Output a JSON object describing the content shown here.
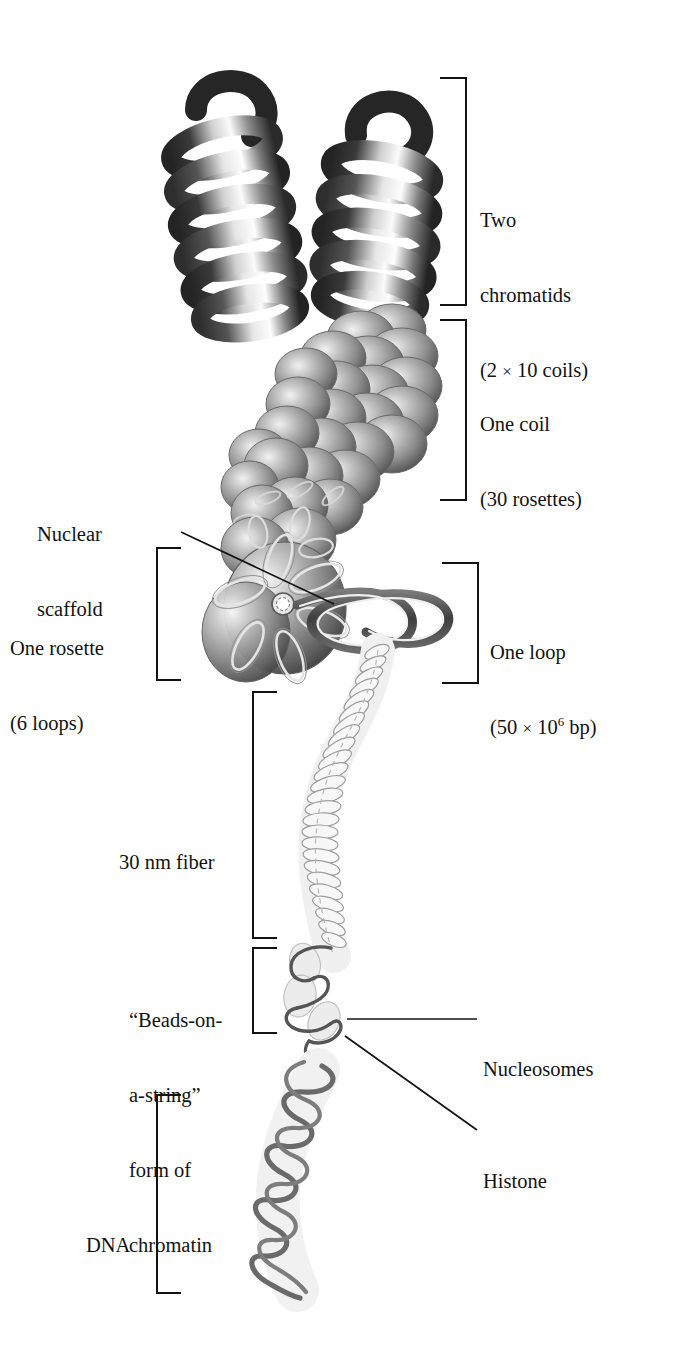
{
  "figure": {
    "background_color": "#ffffff",
    "ink_color": "#131313"
  },
  "labels": {
    "two_chromatids": {
      "line1": "Two",
      "line2": "chromatids",
      "line3_open": "(2 ",
      "line3_times": "×",
      "line3_rest": " 10 coils)"
    },
    "one_coil": {
      "line1": "One coil",
      "line2": "(30 rosettes)"
    },
    "nuclear_scaffold": {
      "line1": "Nuclear",
      "line2": "scaffold"
    },
    "one_rosette": {
      "line1": "One rosette",
      "line2": "(6 loops)"
    },
    "one_loop": {
      "line1": "One loop",
      "line2_open": "(50 ",
      "line2_times": "×",
      "line2_mid": " 10",
      "line2_sup": "6",
      "line2_rest": " bp)"
    },
    "thirty_nm_fiber": {
      "line1": "30 nm fiber"
    },
    "beads_on_a_string": {
      "line1": "“Beads-on-",
      "line2": "a-string”",
      "line3": "form of",
      "line4": "chromatin"
    },
    "nucleosomes": {
      "line1": "Nucleosomes"
    },
    "histone": {
      "line1": "Histone"
    },
    "dna": {
      "line1": "DNA"
    }
  },
  "brackets": [
    {
      "name": "two-chromatids-bracket",
      "side": "right",
      "top": 78,
      "bottom": 305,
      "spine_x": 466,
      "arm_x": 440
    },
    {
      "name": "one-coil-bracket",
      "side": "right",
      "top": 320,
      "bottom": 500,
      "spine_x": 466,
      "arm_x": 440
    },
    {
      "name": "one-loop-bracket",
      "side": "right",
      "top": 563,
      "bottom": 683,
      "spine_x": 478,
      "arm_x": 442
    },
    {
      "name": "one-rosette-bracket",
      "side": "left",
      "top": 548,
      "bottom": 680,
      "spine_x": 157,
      "arm_x": 181
    },
    {
      "name": "thirty-nm-fiber-bracket",
      "side": "left",
      "top": 692,
      "bottom": 938,
      "spine_x": 253,
      "arm_x": 277
    },
    {
      "name": "beads-on-a-string-bracket",
      "side": "left",
      "top": 948,
      "bottom": 1033,
      "spine_x": 253,
      "arm_x": 277
    },
    {
      "name": "dna-bracket",
      "side": "left",
      "top": 1095,
      "bottom": 1293,
      "spine_x": 157,
      "arm_x": 181
    }
  ],
  "leader_lines": [
    {
      "name": "nuclear-scaffold-leader",
      "x1": 181,
      "y1": 532,
      "x2": 334,
      "y2": 604
    },
    {
      "name": "nucleosomes-leader",
      "x1": 347,
      "y1": 1019,
      "x2": 477,
      "y2": 1019
    },
    {
      "name": "histone-leader",
      "x1": 345,
      "y1": 1036,
      "x2": 477,
      "y2": 1130
    }
  ],
  "structure_levels": [
    {
      "name": "two-chromatids",
      "description": "Two helical chromatid arms, each a dark coiled ribbon"
    },
    {
      "name": "one-coil",
      "description": "Chain of overlapping gray rosette spheres forming one coil"
    },
    {
      "name": "one-rosette",
      "description": "Large gray sphere with six loop petals radiating from a central scaffold ring"
    },
    {
      "name": "one-loop",
      "description": "Figure-eight chromatin loop extending to the right of the rosette"
    },
    {
      "name": "thirty-nm-fiber",
      "description": "Pale solenoid of stacked nucleosome discs"
    },
    {
      "name": "beads-on-a-string",
      "description": "Pale nucleosome beads joined by a dark linker string"
    },
    {
      "name": "dna",
      "description": "Dark gray DNA double helix ribbon"
    }
  ],
  "palette": {
    "ink": "#131313",
    "chromatid_dark": "#2b2b2b",
    "chromatid_mid": "#7c7c7c",
    "chromatid_light": "#f4f4f4",
    "sphere_dark": "#5d5d5d",
    "sphere_mid": "#9a9a9a",
    "sphere_light": "#e9e9e9",
    "fiber_pale": "#c9c9c9",
    "dna_strand": "#6e6e6e",
    "loop_dark": "#4a4a4a"
  }
}
